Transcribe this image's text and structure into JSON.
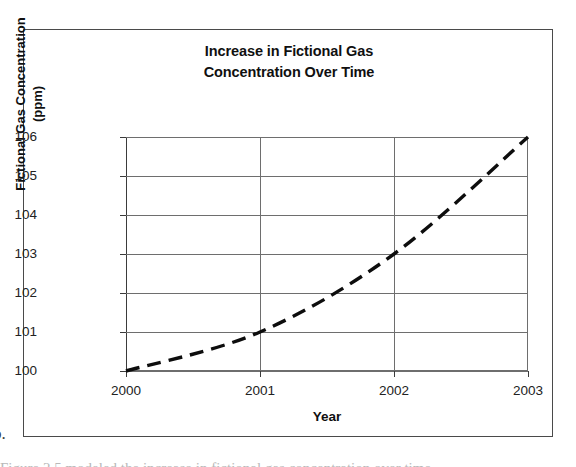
{
  "figure": {
    "caption_marker": "b.",
    "caption_fragment": "Figure 2.5 modeled the increase in fictional gas concentration over time."
  },
  "chart_data": {
    "type": "line",
    "title": "Increase in Fictional Gas\nConcentration Over Time",
    "xlabel": "Year",
    "ylabel": "Fictional Gas Concentration\n(ppm)",
    "x": [
      2000,
      2001,
      2002,
      2003
    ],
    "xtick_labels": [
      "2000",
      "2001",
      "2002",
      "2003"
    ],
    "values": [
      100,
      101,
      103,
      106
    ],
    "series": [
      {
        "name": "Fictional Gas Concentration",
        "values": [
          100,
          101,
          103,
          106
        ],
        "style": "dashed",
        "color": "#0d0d0d"
      }
    ],
    "ytick_labels": [
      "106",
      "105",
      "104",
      "103",
      "102",
      "101",
      "100"
    ],
    "yticks": [
      106,
      105,
      104,
      103,
      102,
      101,
      100
    ],
    "ylim": [
      100,
      106
    ],
    "xlim": [
      2000,
      2003
    ],
    "grid": "horizontal-and-vertical",
    "legend": "none"
  },
  "colors": {
    "frame": "#4a4a4a",
    "gridline": "#6e6e6e",
    "axis": "#3b3b3b",
    "series": "#0d0d0d",
    "text": "#101010",
    "background": "#ffffff"
  }
}
